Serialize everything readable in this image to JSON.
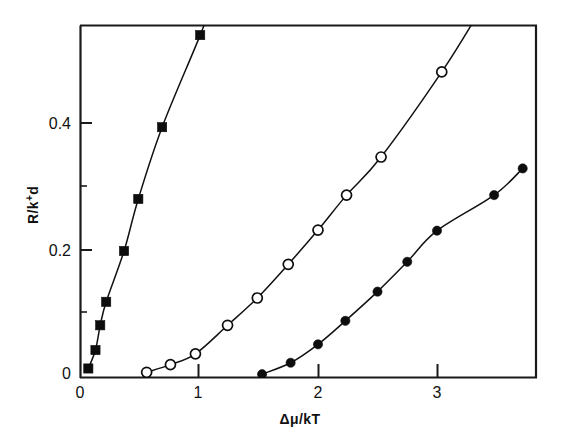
{
  "chart_data": {
    "type": "line",
    "title": "",
    "subtitle": "",
    "xlabel": "Δμ/kT",
    "ylabel": "R/k⁺d",
    "xlim": [
      -0.06,
      3.84
    ],
    "ylim": [
      0,
      0.555
    ],
    "grid": false,
    "legend": "none",
    "xticks": [
      0,
      1,
      2,
      3
    ],
    "xtick_labels": [
      "0",
      "1",
      "2",
      "3"
    ],
    "yticks": [
      0,
      0.2,
      0.4
    ],
    "ytick_labels": [
      "0",
      "0.2",
      "0.4"
    ],
    "annotations": [],
    "series": [
      {
        "name": "filled-squares",
        "marker": "filled-square",
        "color": "#0d0d0d",
        "x": [
          0.07,
          0.13,
          0.17,
          0.22,
          0.37,
          0.49,
          0.69,
          1.01,
          1.17
        ],
        "y": [
          0.015,
          0.044,
          0.083,
          0.12,
          0.2,
          0.282,
          0.395,
          0.54,
          0.62
        ]
      },
      {
        "name": "open-circles",
        "marker": "open-circle",
        "color": "#0d0d0d",
        "x": [
          0.56,
          0.76,
          0.97,
          1.24,
          1.49,
          1.75,
          2.0,
          2.24,
          2.53,
          3.04,
          3.35
        ],
        "y": [
          0.009,
          0.021,
          0.038,
          0.083,
          0.126,
          0.179,
          0.233,
          0.288,
          0.348,
          0.482,
          0.575
        ]
      },
      {
        "name": "filled-circles",
        "marker": "filled-circle",
        "color": "#0d0d0d",
        "x": [
          1.53,
          1.77,
          2.0,
          2.23,
          2.5,
          2.75,
          3.0,
          3.48,
          3.72
        ],
        "y": [
          0.006,
          0.024,
          0.053,
          0.09,
          0.136,
          0.183,
          0.232,
          0.288,
          0.33
        ]
      }
    ]
  },
  "axes": {
    "xlabel": "Δμ/kT",
    "ylabel_main": "R/k",
    "ylabel_sup": "+",
    "ylabel_tail": "d",
    "ylabel_full": "R/k⁺d",
    "x_tick_0": "0",
    "x_tick_1": "1",
    "x_tick_2": "2",
    "x_tick_3": "3",
    "y_tick_0": "0",
    "y_tick_02": "0.2",
    "y_tick_04": "0.4"
  }
}
